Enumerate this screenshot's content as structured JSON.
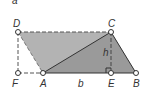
{
  "figure": {
    "corner_label": "a",
    "points": {
      "D": {
        "label": "D",
        "x": 18,
        "y": 32
      },
      "C": {
        "label": "C",
        "x": 111,
        "y": 32
      },
      "F": {
        "label": "F",
        "x": 18,
        "y": 73
      },
      "A": {
        "label": "A",
        "x": 43,
        "y": 73
      },
      "E": {
        "label": "E",
        "x": 111,
        "y": 73
      },
      "B": {
        "label": "B",
        "x": 136,
        "y": 73
      }
    },
    "base_label": "b",
    "height_label": "h",
    "colors": {
      "parallelogram_fill": "#b3b3b3",
      "triangle_fill": "#9a9a9a",
      "line": "#333333",
      "point_fill": "#ffffff"
    }
  }
}
